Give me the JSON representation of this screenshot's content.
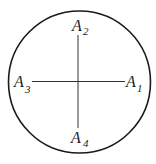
{
  "diagram": {
    "circle": {
      "cx": 79.5,
      "cy": 82,
      "r": 71,
      "stroke": "#1a1a1a"
    },
    "lines": {
      "vertical": {
        "x": 78,
        "y1": 35,
        "y2": 128
      },
      "horizontal": {
        "y": 82,
        "x1": 32,
        "x2": 125
      }
    },
    "labels": [
      {
        "id": "A1",
        "base": "A",
        "sub": "1",
        "position": "right"
      },
      {
        "id": "A2",
        "base": "A",
        "sub": "2",
        "position": "top"
      },
      {
        "id": "A3",
        "base": "A",
        "sub": "3",
        "position": "left"
      },
      {
        "id": "A4",
        "base": "A",
        "sub": "4",
        "position": "bottom"
      }
    ]
  }
}
